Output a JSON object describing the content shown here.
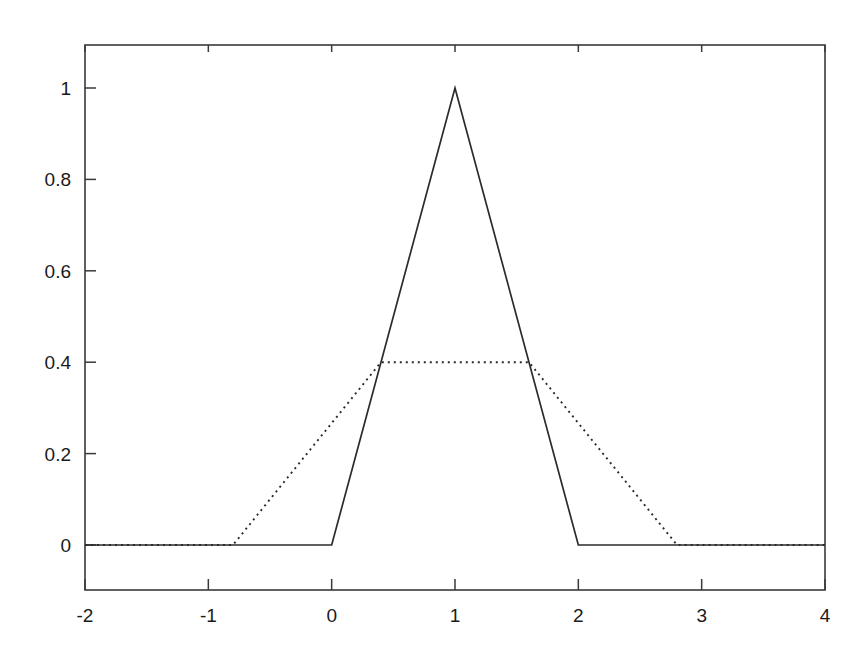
{
  "chart_data": {
    "type": "line",
    "title": "",
    "subtitle": "",
    "xlabel": "",
    "ylabel": "",
    "xlim": [
      -2,
      4
    ],
    "ylim": [
      -0.12,
      1.2
    ],
    "grid": false,
    "legend": null,
    "background_color": "#ffffff",
    "line_color": "#2b2b2b",
    "axis_color": "#3a3a3a",
    "xticks": [
      -2,
      -1,
      0,
      1,
      2,
      3,
      4
    ],
    "xtick_labels": [
      "-2",
      "-1",
      "0",
      "1",
      "2",
      "3",
      "4"
    ],
    "yticks": [
      0,
      0.2,
      0.4,
      0.6,
      0.8,
      1
    ],
    "ytick_labels": [
      "0",
      "0.2",
      "0.4",
      "0.6",
      "0.8",
      "1"
    ],
    "series": [
      {
        "name": "triangular-solid",
        "style": "solid",
        "peak_value": 1,
        "peak_x": 1,
        "support": [
          0,
          2
        ],
        "x": [
          -2,
          0,
          1,
          2,
          4
        ],
        "values": [
          0,
          0,
          1,
          0,
          0
        ]
      },
      {
        "name": "trapezoidal-dotted",
        "style": "dotted",
        "plateau_value": 0.4,
        "plateau_x": [
          0.4,
          1.6
        ],
        "support": [
          -0.8,
          2.8
        ],
        "x": [
          -2,
          -0.8,
          0.4,
          1.6,
          2.8,
          4
        ],
        "values": [
          0,
          0,
          0.4,
          0.4,
          0,
          0
        ]
      }
    ]
  },
  "axes": {
    "frame": {
      "x_min_px": 85,
      "x_max_px": 825,
      "y_min_px": 45,
      "y_max_px": 590
    }
  }
}
